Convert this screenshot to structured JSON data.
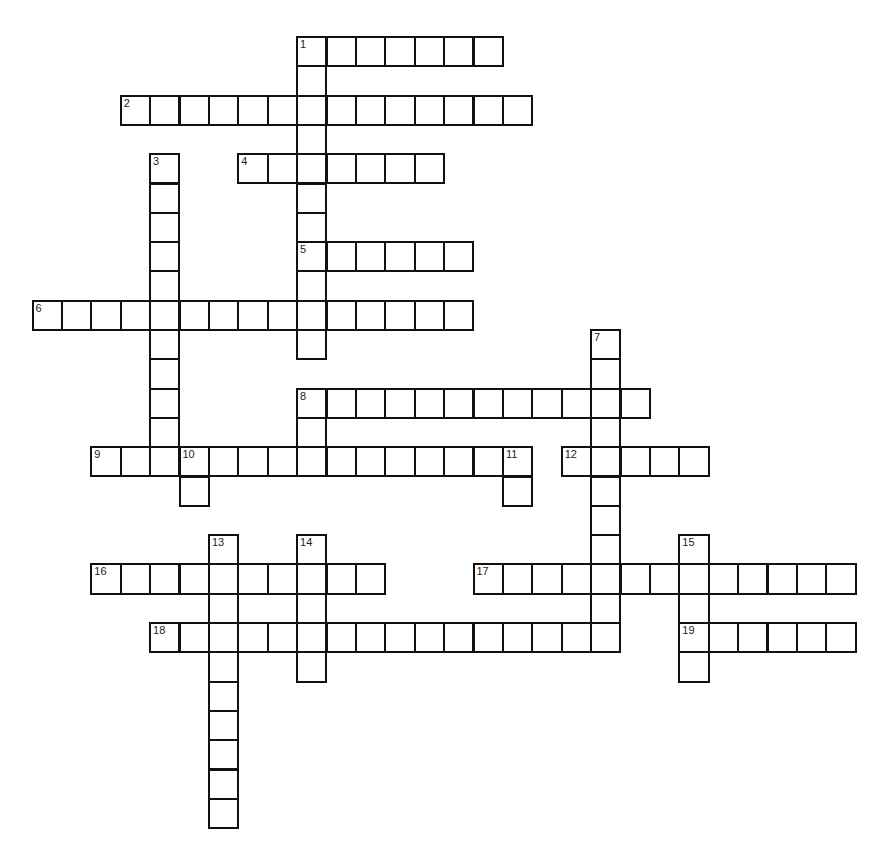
{
  "puzzle": {
    "type": "crossword",
    "grid": {
      "origin_x": 32.5,
      "origin_y": 37,
      "cell_w": 29.4,
      "cell_h": 29.3,
      "cols": 29,
      "rows": 27
    },
    "colors": {
      "line": "#111111",
      "cell_bg": "#ffffff",
      "number": "#222222"
    },
    "entries": [
      {
        "number": 1,
        "direction": "across",
        "row": 0,
        "col": 9,
        "length": 7
      },
      {
        "number": 1,
        "direction": "down",
        "row": 0,
        "col": 9,
        "length": 11
      },
      {
        "number": 2,
        "direction": "across",
        "row": 2,
        "col": 3,
        "length": 14
      },
      {
        "number": 3,
        "direction": "down",
        "row": 4,
        "col": 4,
        "length": 11
      },
      {
        "number": 4,
        "direction": "across",
        "row": 4,
        "col": 7,
        "length": 7
      },
      {
        "number": 5,
        "direction": "across",
        "row": 7,
        "col": 9,
        "length": 6
      },
      {
        "number": 6,
        "direction": "across",
        "row": 9,
        "col": 0,
        "length": 15
      },
      {
        "number": 7,
        "direction": "down",
        "row": 10,
        "col": 19,
        "length": 11
      },
      {
        "number": 8,
        "direction": "across",
        "row": 12,
        "col": 9,
        "length": 12
      },
      {
        "number": 8,
        "direction": "down",
        "row": 12,
        "col": 9,
        "length": 3
      },
      {
        "number": 9,
        "direction": "across",
        "row": 14,
        "col": 2,
        "length": 15
      },
      {
        "number": 10,
        "direction": "down",
        "row": 14,
        "col": 5,
        "length": 2
      },
      {
        "number": 11,
        "direction": "down",
        "row": 14,
        "col": 16,
        "length": 2
      },
      {
        "number": 12,
        "direction": "across",
        "row": 14,
        "col": 18,
        "length": 5
      },
      {
        "number": 13,
        "direction": "down",
        "row": 17,
        "col": 6,
        "length": 10
      },
      {
        "number": 14,
        "direction": "down",
        "row": 17,
        "col": 9,
        "length": 5
      },
      {
        "number": 15,
        "direction": "down",
        "row": 17,
        "col": 22,
        "length": 5
      },
      {
        "number": 16,
        "direction": "across",
        "row": 18,
        "col": 2,
        "length": 10
      },
      {
        "number": 17,
        "direction": "across",
        "row": 18,
        "col": 15,
        "length": 13
      },
      {
        "number": 18,
        "direction": "across",
        "row": 20,
        "col": 4,
        "length": 16
      },
      {
        "number": 19,
        "direction": "across",
        "row": 20,
        "col": 22,
        "length": 6
      }
    ]
  }
}
